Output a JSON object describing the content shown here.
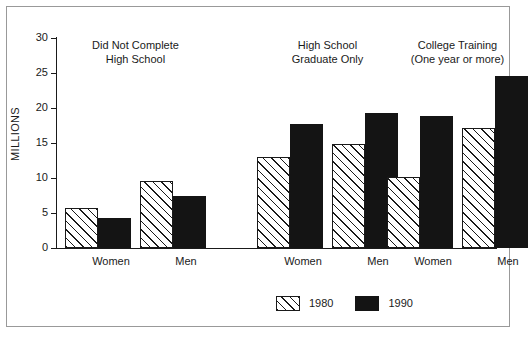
{
  "chart_data": {
    "type": "bar",
    "title": "",
    "xlabel": "",
    "ylabel": "MILLIONS",
    "ylim": [
      0,
      30
    ],
    "yticks": [
      0,
      5,
      10,
      15,
      20,
      25,
      30
    ],
    "ytick_labels": [
      "0",
      "5",
      "10",
      "15",
      "20",
      "25",
      "30"
    ],
    "grid": false,
    "legend_position": "bottom-center",
    "group_titles": [
      "Did Not Complete\nHigh School",
      "High School\nGraduate Only",
      "College Training\n(One year or more)"
    ],
    "groups": [
      {
        "title_line1": "Did Not Complete",
        "title_line2": "High School",
        "categories": [
          "Women",
          "Men"
        ]
      },
      {
        "title_line1": "High School",
        "title_line2": "Graduate Only",
        "categories": [
          "Women",
          "Men"
        ]
      },
      {
        "title_line1": "College Training",
        "title_line2": "(One year or more)",
        "categories": [
          "Women",
          "Men"
        ]
      }
    ],
    "categories": [
      "Did Not Complete High School - Women",
      "Did Not Complete High School - Men",
      "High School Graduate Only - Women",
      "High School Graduate Only - Men",
      "College Training - Women",
      "College Training - Men"
    ],
    "series": [
      {
        "name": "1980",
        "values": [
          5.7,
          9.6,
          13.0,
          14.8,
          10.1,
          17.2
        ]
      },
      {
        "name": "1990",
        "values": [
          4.3,
          7.4,
          17.7,
          19.3,
          18.8,
          24.6
        ]
      }
    ],
    "legend": [
      {
        "label": "1980",
        "pattern": "diagonal-hatch",
        "color": "#ffffff"
      },
      {
        "label": "1990",
        "pattern": "solid",
        "color": "#141414"
      }
    ]
  },
  "colors": {
    "axis": "#1a1a1a",
    "frame": "#999999",
    "background": "#ffffff",
    "series_1980": "#ffffff",
    "series_1990": "#141414"
  }
}
